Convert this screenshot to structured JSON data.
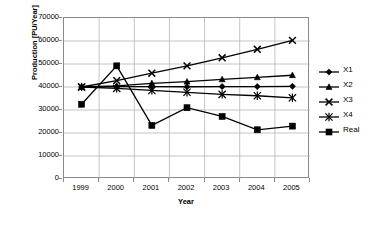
{
  "chart_data": {
    "type": "line",
    "title": "",
    "xlabel": "Year",
    "ylabel": "Production [PU/Year]",
    "categories": [
      "1999",
      "2000",
      "2001",
      "2002",
      "2003",
      "2004",
      "2005"
    ],
    "x": [
      1999,
      2000,
      2001,
      2002,
      2003,
      2004,
      2005
    ],
    "ylim": [
      0,
      70000
    ],
    "yticks": [
      0,
      10000,
      20000,
      30000,
      40000,
      50000,
      60000,
      70000
    ],
    "ytick_labels": [
      "0",
      "10000",
      "20000",
      "30000",
      "40000",
      "50000",
      "60000",
      "70000"
    ],
    "grid": true,
    "legend_position": "right",
    "series": [
      {
        "name": "X1",
        "marker": "diamond",
        "values": [
          40000,
          40200,
          40200,
          40100,
          40200,
          40200,
          40300
        ]
      },
      {
        "name": "X2",
        "marker": "triangle",
        "values": [
          40000,
          40500,
          41600,
          42300,
          43300,
          44200,
          45100
        ]
      },
      {
        "name": "X3",
        "marker": "x",
        "values": [
          40000,
          42800,
          46000,
          49200,
          52700,
          56400,
          60300
        ]
      },
      {
        "name": "X4",
        "marker": "asterisk",
        "values": [
          40000,
          39400,
          38500,
          37700,
          36800,
          36200,
          35300
        ]
      },
      {
        "name": "Real",
        "marker": "square",
        "values": [
          32500,
          49200,
          23300,
          31000,
          27200,
          21400,
          23000
        ]
      }
    ]
  },
  "legend": {
    "entries": [
      {
        "label": "X1"
      },
      {
        "label": "X2"
      },
      {
        "label": "X3"
      },
      {
        "label": "X4"
      },
      {
        "label": "Real"
      }
    ]
  },
  "colors": {
    "series": "#000000",
    "grid": "#b5b5b5",
    "frame": "#8a8a8a",
    "background": "#ffffff"
  }
}
